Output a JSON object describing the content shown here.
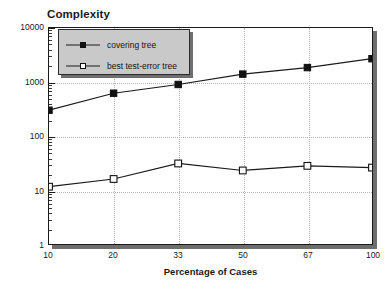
{
  "chart_data": {
    "type": "line",
    "title": "Complexity",
    "xlabel": "Percentage of Cases",
    "ylabel": "",
    "yscale": "log",
    "ylim": [
      1,
      10000
    ],
    "ytick_labels": [
      "1",
      "10",
      "100",
      "1000",
      "10000"
    ],
    "ytick_values": [
      1,
      10,
      100,
      1000,
      10000
    ],
    "grid": true,
    "legend_position": "upper-left-inside",
    "categories": [
      "10",
      "20",
      "33",
      "50",
      "67",
      "100"
    ],
    "x": [
      10,
      20,
      33,
      50,
      67,
      100
    ],
    "series": [
      {
        "name": "covering tree",
        "marker": "filled-square",
        "values": [
          300,
          620,
          900,
          1400,
          1850,
          2700
        ]
      },
      {
        "name": "best test-error tree",
        "marker": "open-square",
        "values": [
          11.5,
          16,
          31,
          23,
          28,
          26
        ]
      }
    ]
  },
  "legend": {
    "items": [
      {
        "label": "covering tree",
        "marker": "filled-square"
      },
      {
        "label": "best test-error tree",
        "marker": "open-square"
      }
    ]
  },
  "colors": {
    "line": "#1a1a1a",
    "grid": "#b4b4b4",
    "frame": "#1a1a1a",
    "shadow": "#6e6e6e",
    "legend_background": "#c9c9c9",
    "text": "#1a1a1a",
    "background": "#ffffff"
  }
}
